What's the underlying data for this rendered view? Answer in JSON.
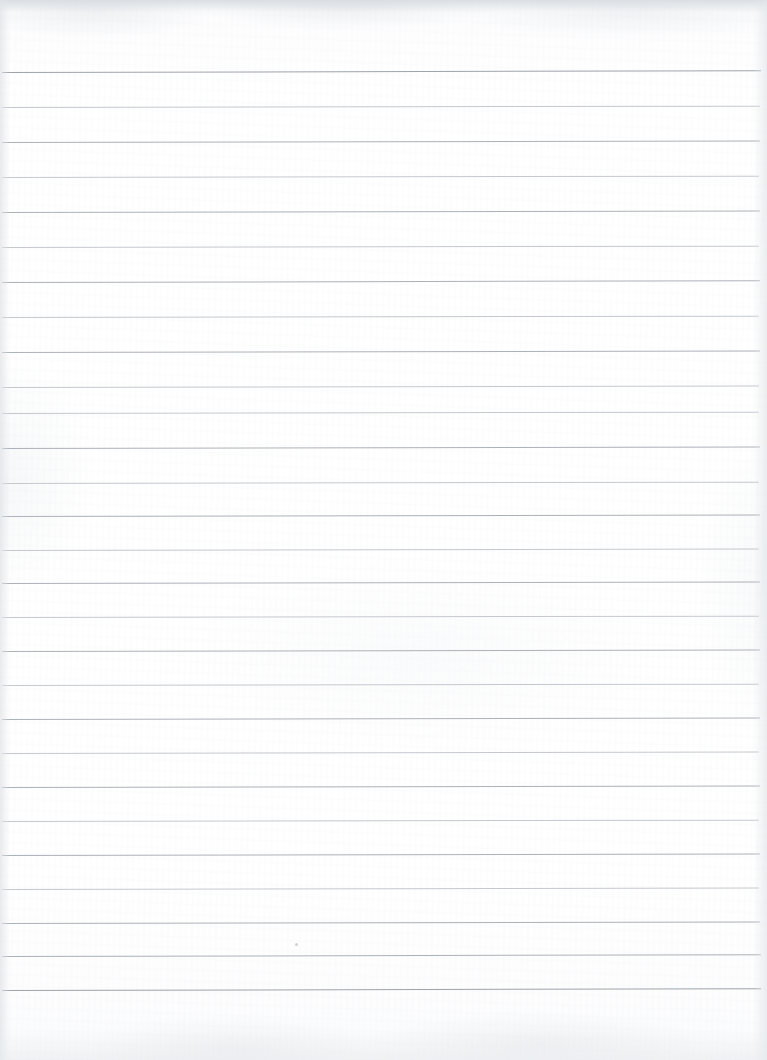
{
  "document": {
    "title": "Scanned blank lined notebook page",
    "kind": "scanned-paper",
    "orientation": "portrait",
    "page_width_px": 767,
    "page_height_px": 1060,
    "background_color": "#ffffff",
    "paper_tint": "#fdfdfe",
    "has_text_content": false,
    "has_handwriting": false,
    "visible_text": ""
  },
  "ruling": {
    "style": "horizontal ruled (wide ruled)",
    "line_count": 27,
    "line_spacing_px": 35,
    "first_line_y_px": 72,
    "last_line_y_px": 990,
    "line_thickness_px": 1,
    "line_color": "#b9bdc2",
    "heavy_line_color": "#9ea4ab",
    "light_line_color": "#c5c9ce",
    "left_inset_px": 2,
    "right_inset_px": 8,
    "slant_deg": -0.12,
    "margin_rule": "none",
    "top_margin_px": 72,
    "bottom_margin_px": 70
  },
  "lines": [
    {
      "y": 72,
      "weight": "heavy",
      "left": 2,
      "right": 761,
      "slant": -0.14
    },
    {
      "y": 107,
      "weight": "light",
      "left": 2,
      "right": 760,
      "slant": -0.1
    },
    {
      "y": 142,
      "weight": "medium",
      "left": 2,
      "right": 760,
      "slant": -0.12
    },
    {
      "y": 177,
      "weight": "light",
      "left": 2,
      "right": 759,
      "slant": -0.1
    },
    {
      "y": 212,
      "weight": "medium",
      "left": 2,
      "right": 760,
      "slant": -0.12
    },
    {
      "y": 247,
      "weight": "light",
      "left": 2,
      "right": 759,
      "slant": -0.1
    },
    {
      "y": 282,
      "weight": "medium",
      "left": 2,
      "right": 760,
      "slant": -0.13
    },
    {
      "y": 317,
      "weight": "light",
      "left": 2,
      "right": 759,
      "slant": -0.1
    },
    {
      "y": 352,
      "weight": "medium",
      "left": 2,
      "right": 760,
      "slant": -0.12
    },
    {
      "y": 387,
      "weight": "light",
      "left": 2,
      "right": 759,
      "slant": -0.11
    },
    {
      "y": 413,
      "weight": "light",
      "left": 2,
      "right": 759,
      "slant": -0.1
    },
    {
      "y": 448,
      "weight": "medium",
      "left": 2,
      "right": 760,
      "slant": -0.12
    },
    {
      "y": 483,
      "weight": "light",
      "left": 2,
      "right": 759,
      "slant": -0.1
    },
    {
      "y": 516,
      "weight": "medium",
      "left": 2,
      "right": 760,
      "slant": -0.12
    },
    {
      "y": 550,
      "weight": "light",
      "left": 2,
      "right": 759,
      "slant": -0.11
    },
    {
      "y": 583,
      "weight": "medium",
      "left": 2,
      "right": 760,
      "slant": -0.12
    },
    {
      "y": 617,
      "weight": "light",
      "left": 2,
      "right": 759,
      "slant": -0.1
    },
    {
      "y": 651,
      "weight": "medium",
      "left": 2,
      "right": 760,
      "slant": -0.12
    },
    {
      "y": 685,
      "weight": "light",
      "left": 2,
      "right": 759,
      "slant": -0.1
    },
    {
      "y": 719,
      "weight": "medium",
      "left": 2,
      "right": 760,
      "slant": -0.12
    },
    {
      "y": 753,
      "weight": "light",
      "left": 2,
      "right": 759,
      "slant": -0.11
    },
    {
      "y": 787,
      "weight": "medium",
      "left": 2,
      "right": 760,
      "slant": -0.12
    },
    {
      "y": 821,
      "weight": "light",
      "left": 2,
      "right": 759,
      "slant": -0.1
    },
    {
      "y": 855,
      "weight": "medium",
      "left": 2,
      "right": 760,
      "slant": -0.12
    },
    {
      "y": 889,
      "weight": "light",
      "left": 2,
      "right": 759,
      "slant": -0.11
    },
    {
      "y": 923,
      "weight": "medium",
      "left": 2,
      "right": 760,
      "slant": -0.12
    },
    {
      "y": 956,
      "weight": "medium",
      "left": 2,
      "right": 761,
      "slant": -0.13
    },
    {
      "y": 990,
      "weight": "heavy",
      "left": 2,
      "right": 761,
      "slant": -0.14
    }
  ],
  "artifacts": {
    "top_band": {
      "y": 0,
      "height": 12,
      "description": "grey scanner edge band",
      "color": "#d6dbe0"
    },
    "bottom_band": {
      "y": 1030,
      "height": 30,
      "description": "soft scanner edge shading",
      "color": "#e8ebee"
    },
    "specks": [
      {
        "x": 295,
        "y": 943,
        "size": 3
      }
    ]
  }
}
